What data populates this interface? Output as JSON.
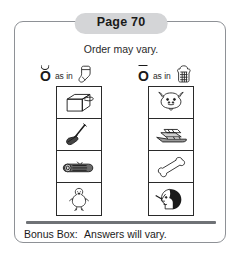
{
  "header": {
    "page_label": "Page 70"
  },
  "note": {
    "order_text": "Order may vary."
  },
  "headings": [
    {
      "vowel": "O",
      "diacritic": "breve",
      "as_in_text": "as in",
      "cue_icon": "sock-icon",
      "cue_word": "sock"
    },
    {
      "vowel": "O",
      "diacritic": "macron",
      "as_in_text": "as in",
      "cue_icon": "toast-icon",
      "cue_word": "toast"
    }
  ],
  "columns": [
    {
      "name": "short-o-column",
      "cells": [
        {
          "icon": "box-icon",
          "word": "box"
        },
        {
          "icon": "mop-icon",
          "word": "mop"
        },
        {
          "icon": "log-icon",
          "word": "log"
        },
        {
          "icon": "ostrich-icon",
          "word": "ostrich"
        }
      ]
    },
    {
      "name": "long-o-column",
      "cells": [
        {
          "icon": "goat-icon",
          "word": "goat"
        },
        {
          "icon": "boat-icon",
          "word": "boat"
        },
        {
          "icon": "bone-icon",
          "word": "bone"
        },
        {
          "icon": "nose-icon",
          "word": "nose"
        }
      ]
    }
  ],
  "bonus": {
    "label": "Bonus Box:",
    "text": "Answers will vary."
  },
  "colors": {
    "pill_background": "#d4d5d7",
    "frame_border": "#8e9196",
    "divider": "#6f7276",
    "ink": "#1a1a1a"
  }
}
